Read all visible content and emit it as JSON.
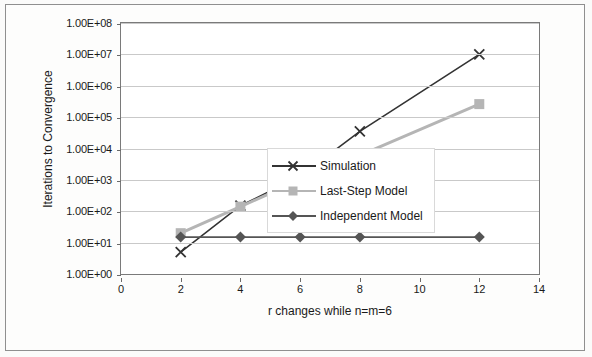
{
  "chart_data": {
    "type": "line",
    "title": "",
    "xlabel": "r changes while n=m=6",
    "ylabel": "Iterations to Convergence",
    "yscale": "log",
    "xlim": [
      0,
      14
    ],
    "ylim": [
      1,
      100000000
    ],
    "grid": true,
    "legend_position": "inside-right",
    "x_ticks": [
      "0",
      "2",
      "4",
      "6",
      "8",
      "10",
      "12",
      "14"
    ],
    "y_ticks": [
      "1.00E+00",
      "1.00E+01",
      "1.00E+02",
      "1.00E+03",
      "1.00E+04",
      "1.00E+05",
      "1.00E+06",
      "1.00E+07",
      "1.00E+08"
    ],
    "series": [
      {
        "name": "Simulation",
        "color": "#333333",
        "marker": "x",
        "x": [
          2,
          4,
          6,
          8,
          12
        ],
        "values": [
          5,
          150,
          1300,
          35000,
          10000000
        ]
      },
      {
        "name": "Last-Step Model",
        "color": "#b5b5b5",
        "marker": "square",
        "x": [
          2,
          4,
          6,
          8,
          12
        ],
        "values": [
          20,
          140,
          1000,
          6000,
          260000
        ]
      },
      {
        "name": "Independent Model",
        "color": "#555555",
        "marker": "diamond",
        "x": [
          2,
          4,
          6,
          8,
          12
        ],
        "values": [
          15,
          15,
          15,
          15,
          15
        ]
      }
    ]
  },
  "legend": {
    "items": [
      {
        "label": "Simulation"
      },
      {
        "label": "Last-Step Model"
      },
      {
        "label": "Independent Model"
      }
    ]
  }
}
